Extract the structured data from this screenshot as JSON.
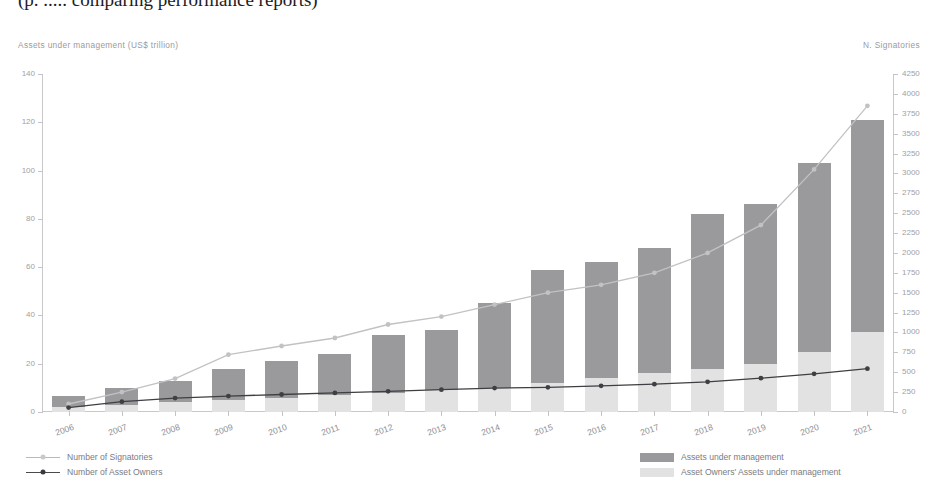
{
  "title_sliver": "(p. ..... comparing performance reports)",
  "axes": {
    "left_caption": "Assets under management (US$ trillion)",
    "right_caption": "N. Signatories",
    "left_ticks": [
      0,
      20,
      40,
      60,
      80,
      100,
      120,
      140
    ],
    "right_ticks": [
      0,
      250,
      500,
      750,
      1000,
      1250,
      1500,
      1750,
      2000,
      2250,
      2500,
      2750,
      3000,
      3250,
      3500,
      3750,
      4000,
      4250
    ],
    "left_min": 0,
    "left_max": 140,
    "right_min": 0,
    "right_max": 4250
  },
  "legend": {
    "left": [
      {
        "label": "Number of Signatories",
        "color": "#b9b9bd",
        "marker": "#c9c9cd",
        "type": "line"
      },
      {
        "label": "Number of Asset Owners",
        "color": "#4a4a4e",
        "marker": "#3a3a3e",
        "type": "line"
      }
    ],
    "right": [
      {
        "label": "Assets under management",
        "color": "#9a9a9d",
        "type": "box"
      },
      {
        "label": "Asset Owners' Assets under management",
        "color": "#e2e2e3",
        "type": "box"
      }
    ]
  },
  "chart_data": {
    "type": "bar",
    "title": "",
    "subtitle": "",
    "xlabel": "",
    "ylabel": "Assets under management (US$ trillion)",
    "y2label": "N. Signatories",
    "ylim": [
      0,
      140
    ],
    "y2lim": [
      0,
      4250
    ],
    "grid": false,
    "legend_position": "bottom",
    "stacked": true,
    "categories": [
      "2006",
      "2007",
      "2008",
      "2009",
      "2010",
      "2011",
      "2012",
      "2013",
      "2014",
      "2015",
      "2016",
      "2017",
      "2018",
      "2019",
      "2020",
      "2021"
    ],
    "series": [
      {
        "name": "Assets under management",
        "axis": "left",
        "unit": "US$ trillion",
        "type": "bar",
        "color": "#9a9a9d",
        "values": [
          6.5,
          10,
          13,
          18,
          21,
          24,
          32,
          34,
          45,
          59,
          62,
          68,
          82,
          86,
          103,
          121
        ]
      },
      {
        "name": "Asset Owners' Assets under management",
        "axis": "left",
        "unit": "US$ trillion",
        "type": "bar",
        "color": "#e2e2e3",
        "values": [
          2,
          3,
          4,
          5,
          6,
          7,
          8,
          9,
          10,
          12,
          14,
          16,
          18,
          20,
          25,
          33
        ]
      },
      {
        "name": "Number of Signatories",
        "axis": "right",
        "unit": "signatories",
        "type": "line",
        "color": "#c2c2c6",
        "values": [
          100,
          250,
          420,
          720,
          830,
          930,
          1100,
          1200,
          1350,
          1500,
          1600,
          1750,
          2000,
          2350,
          3050,
          3850
        ]
      },
      {
        "name": "Number of Asset Owners",
        "axis": "right",
        "unit": "signatories",
        "type": "line",
        "color": "#3f3f43",
        "values": [
          55,
          130,
          175,
          200,
          220,
          240,
          260,
          280,
          300,
          310,
          330,
          350,
          380,
          425,
          480,
          545
        ]
      }
    ]
  }
}
